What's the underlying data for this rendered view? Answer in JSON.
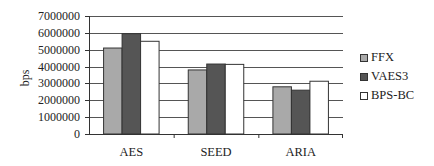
{
  "chart_data": {
    "type": "bar",
    "title": "",
    "xlabel": "",
    "ylabel": "bps",
    "categories": [
      "AES",
      "SEED",
      "ARIA"
    ],
    "series": [
      {
        "name": "FFX",
        "color": "#a9a9a9",
        "values": [
          5100000,
          3800000,
          2800000
        ]
      },
      {
        "name": "VAES3",
        "color": "#555555",
        "values": [
          5950000,
          4150000,
          2600000
        ]
      },
      {
        "name": "BPS-BC",
        "color": "#ffffff",
        "values": [
          5500000,
          4130000,
          3130000
        ]
      }
    ],
    "ylim": [
      0,
      7000000
    ],
    "yticks": [
      "0",
      "1000000",
      "2000000",
      "3000000",
      "4000000",
      "5000000",
      "6000000",
      "7000000"
    ],
    "grid": true,
    "legend_position": "right"
  }
}
